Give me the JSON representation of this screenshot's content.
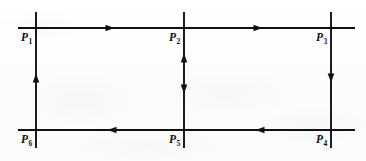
{
  "figure": {
    "type": "mesh-circuit-loop-diagram",
    "canvas": {
      "width": 366,
      "height": 161
    },
    "background_color": "#fdfdfd",
    "ink_color": "#111111",
    "line_width": 1.9,
    "nodes": [
      {
        "id": "P1",
        "label": "P",
        "subscript": "1",
        "x": 36,
        "y": 28,
        "label_x": 21,
        "label_y": 32
      },
      {
        "id": "P2",
        "label": "P",
        "subscript": "2",
        "x": 184,
        "y": 28,
        "label_x": 169,
        "label_y": 32
      },
      {
        "id": "P3",
        "label": "P",
        "subscript": "3",
        "x": 331,
        "y": 28,
        "label_x": 316,
        "label_y": 32
      },
      {
        "id": "P4",
        "label": "P",
        "subscript": "4",
        "x": 331,
        "y": 130,
        "label_x": 316,
        "label_y": 134
      },
      {
        "id": "P5",
        "label": "P",
        "subscript": "5",
        "x": 184,
        "y": 130,
        "label_x": 169,
        "label_y": 134
      },
      {
        "id": "P6",
        "label": "P",
        "subscript": "6",
        "x": 36,
        "y": 130,
        "label_x": 21,
        "label_y": 134
      }
    ],
    "rails": [
      {
        "id": "top-rail",
        "orientation": "horizontal",
        "x1": 18,
        "y1": 28,
        "x2": 355,
        "y2": 28
      },
      {
        "id": "bottom-rail",
        "orientation": "horizontal",
        "x1": 18,
        "y1": 130,
        "x2": 355,
        "y2": 130
      },
      {
        "id": "left-riser",
        "orientation": "vertical",
        "x1": 36,
        "y1": 12,
        "x2": 36,
        "y2": 148
      },
      {
        "id": "middle-riser",
        "orientation": "vertical",
        "x1": 184,
        "y1": 12,
        "x2": 184,
        "y2": 148
      },
      {
        "id": "right-riser",
        "orientation": "vertical",
        "x1": 331,
        "y1": 12,
        "x2": 331,
        "y2": 148
      }
    ],
    "arrows": [
      {
        "id": "arrow-top-left-segment",
        "segment": "P1-to-P2",
        "x": 110,
        "y": 28,
        "direction": "right"
      },
      {
        "id": "arrow-top-right-segment",
        "segment": "P2-to-P3",
        "x": 258,
        "y": 28,
        "direction": "right"
      },
      {
        "id": "arrow-bottom-left-segment",
        "segment": "P5-to-P6",
        "x": 112,
        "y": 130,
        "direction": "left"
      },
      {
        "id": "arrow-bottom-right-segment",
        "segment": "P4-to-P5",
        "x": 260,
        "y": 130,
        "direction": "left"
      },
      {
        "id": "arrow-left-riser",
        "segment": "P6-to-P1",
        "x": 36,
        "y": 78,
        "direction": "up"
      },
      {
        "id": "arrow-middle-riser-upper",
        "segment": "P2-branch",
        "x": 184,
        "y": 58,
        "direction": "up"
      },
      {
        "id": "arrow-middle-riser-lower",
        "segment": "P5-branch",
        "x": 184,
        "y": 89,
        "direction": "down"
      },
      {
        "id": "arrow-right-riser",
        "segment": "P3-to-P4",
        "x": 331,
        "y": 78,
        "direction": "down"
      }
    ]
  }
}
